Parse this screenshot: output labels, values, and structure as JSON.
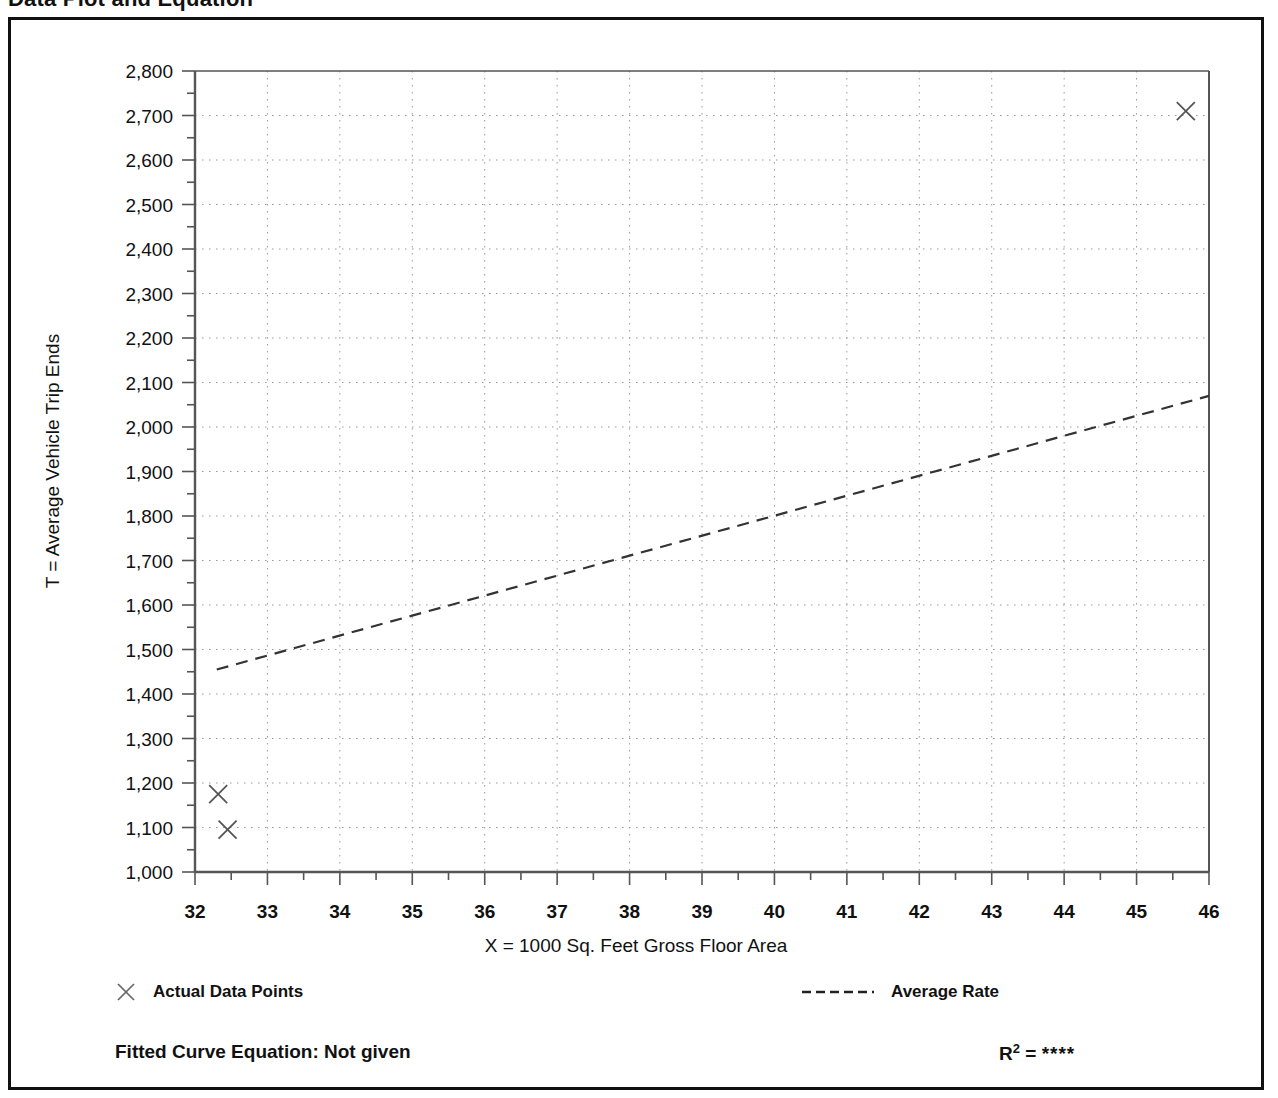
{
  "header": {
    "title": "Data Plot and Equation",
    "right_note": ""
  },
  "axes": {
    "y_title": "T = Average Vehicle Trip Ends",
    "x_title": "X = 1000 Sq. Feet Gross Floor Area"
  },
  "legend": {
    "data_points_label": "Actual Data Points",
    "average_rate_label": "Average Rate",
    "equation_label": "Fitted Curve Equation:  Not given",
    "r2_label": "R",
    "r2_exponent": "2",
    "r2_equals": " = ",
    "r2_value": "****"
  },
  "chart_data": {
    "type": "scatter",
    "title": "Data Plot and Equation",
    "xlabel": "X = 1000 Sq. Feet Gross Floor Area",
    "ylabel": "T = Average Vehicle Trip Ends",
    "xlim": [
      32,
      46
    ],
    "ylim": [
      1000,
      2800
    ],
    "x_major_step": 1,
    "x_minor_step": 0.5,
    "y_major_step": 100,
    "y_minor_step": 50,
    "grid": true,
    "grid_style": "dotted",
    "x_ticks": [
      32,
      33,
      34,
      35,
      36,
      37,
      38,
      39,
      40,
      41,
      42,
      43,
      44,
      45,
      46
    ],
    "x_tick_labels": [
      "32",
      "33",
      "34",
      "35",
      "36",
      "37",
      "38",
      "39",
      "40",
      "41",
      "42",
      "43",
      "44",
      "45",
      "46"
    ],
    "y_ticks": [
      1000,
      1100,
      1200,
      1300,
      1400,
      1500,
      1600,
      1700,
      1800,
      1900,
      2000,
      2100,
      2200,
      2300,
      2400,
      2500,
      2600,
      2700,
      2800
    ],
    "y_tick_labels": [
      "1,000",
      "1,100",
      "1,200",
      "1,300",
      "1,400",
      "1,500",
      "1,600",
      "1,700",
      "1,800",
      "1,900",
      "2,000",
      "2,100",
      "2,200",
      "2,300",
      "2,400",
      "2,500",
      "2,600",
      "2,700",
      "2,800"
    ],
    "series": [
      {
        "name": "Actual Data Points",
        "type": "scatter",
        "marker": "x",
        "color": "#555555",
        "points": [
          {
            "x": 32.32,
            "y": 1175
          },
          {
            "x": 32.45,
            "y": 1095
          },
          {
            "x": 45.68,
            "y": 2710
          }
        ]
      },
      {
        "name": "Average Rate",
        "type": "line",
        "style": "dashed",
        "color": "#333333",
        "endpoints": [
          {
            "x": 32.3,
            "y": 1455
          },
          {
            "x": 46.0,
            "y": 2070
          }
        ]
      }
    ]
  },
  "colors": {
    "frame": "#111111",
    "axis": "#555555",
    "grid": "#999999",
    "marker": "#555555",
    "line": "#333333",
    "text": "#111111"
  }
}
